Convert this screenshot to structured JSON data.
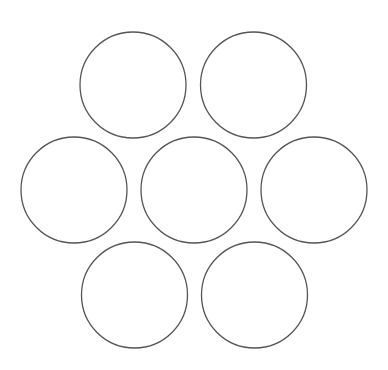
{
  "diagram": {
    "type": "hexagonal-circle-packing",
    "background": "#ffffff",
    "stroke_color": "#555555",
    "stroke_width": 1.3,
    "fill": "#ffffff",
    "circles": [
      {
        "id": "top-left",
        "cx": 133,
        "cy": 85,
        "r": 53
      },
      {
        "id": "top-right",
        "cx": 253.5,
        "cy": 85,
        "r": 53
      },
      {
        "id": "middle-left",
        "cx": 74,
        "cy": 190,
        "r": 53
      },
      {
        "id": "middle-center",
        "cx": 194,
        "cy": 190,
        "r": 53
      },
      {
        "id": "middle-right",
        "cx": 314,
        "cy": 190,
        "r": 53
      },
      {
        "id": "bottom-left",
        "cx": 134.5,
        "cy": 295,
        "r": 53
      },
      {
        "id": "bottom-right",
        "cx": 254.5,
        "cy": 295,
        "r": 53
      }
    ]
  }
}
